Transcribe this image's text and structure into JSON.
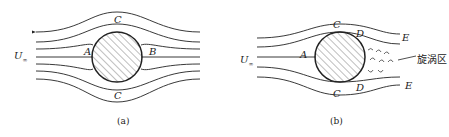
{
  "figures": [
    {
      "caption": "(a)",
      "labels": {
        "u": "U",
        "u_sub": "∞",
        "a": "A",
        "b": "B",
        "c_top": "C",
        "c_bottom": "C"
      }
    },
    {
      "caption": "(b)",
      "labels": {
        "u": "U",
        "u_sub": "∞",
        "a": "A",
        "c_top": "C",
        "c_bottom": "C",
        "d_top": "D",
        "d_bottom": "D",
        "e_top": "E",
        "e_bottom": "E",
        "vortex": "旋涡区"
      }
    }
  ],
  "colors": {
    "line": "#222222",
    "hatch": "#444444"
  }
}
